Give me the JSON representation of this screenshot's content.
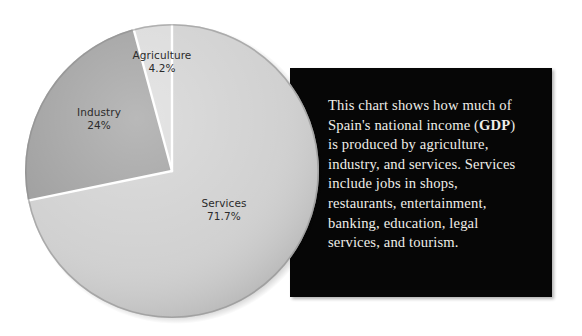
{
  "chart_data": {
    "type": "pie",
    "title": "",
    "subtitle": "",
    "xlabel": "",
    "ylabel": "",
    "legend_position": "none",
    "grid": false,
    "start_angle_deg": 90,
    "direction": "counterclockwise",
    "categories": [
      "Agriculture",
      "Industry",
      "Services"
    ],
    "values": [
      4.2,
      24.0,
      71.7
    ],
    "unit": "%",
    "slices": [
      {
        "name": "Agriculture",
        "value": 4.2,
        "value_label": "4.2%",
        "color": "#d9d9d9"
      },
      {
        "name": "Industry",
        "value": 24.0,
        "value_label": "24%",
        "color": "#9b9b9b"
      },
      {
        "name": "Services",
        "value": 71.7,
        "value_label": "71.7%",
        "color": "#cfcfcf"
      }
    ]
  },
  "labels": {
    "agriculture": {
      "name": "Agriculture",
      "value": "4.2%"
    },
    "industry": {
      "name": "Industry",
      "value": "24%"
    },
    "services": {
      "name": "Services",
      "value": "71.7%"
    }
  },
  "caption": {
    "part1": "This chart shows how much of Spain's national income (",
    "bold_term": "GDP",
    "part2": ") is produced by agriculture, industry, and services. Services include jobs in shops, restaurants, entertainment, banking, education, legal services, and tourism."
  },
  "colors": {
    "panel_background": "#060606",
    "caption_text": "#efeee9",
    "page_background": "#ffffff",
    "slice_separator": "#ffffff",
    "label_text": "#2b2b2b"
  }
}
